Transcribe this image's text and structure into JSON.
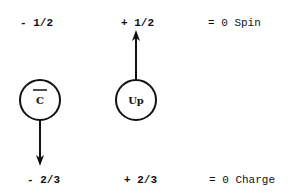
{
  "spin_row": {
    "antiquark_spin": "- 1/2",
    "quark_spin": "+ 1/2",
    "total": "= 0 Spin"
  },
  "charge_row": {
    "antiquark_charge": "- 2/3",
    "quark_charge": "+ 2/3",
    "total": "= 0 Charge"
  },
  "particles": [
    {
      "label": "C",
      "overbar": true,
      "arrow": "down"
    },
    {
      "label": "Up",
      "overbar": false,
      "arrow": "up"
    }
  ]
}
